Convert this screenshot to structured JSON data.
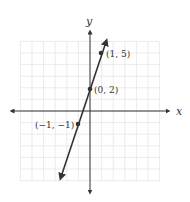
{
  "chart_data": {
    "type": "line",
    "title": "",
    "xlabel": "x",
    "ylabel": "y",
    "xlim": [
      -6,
      6
    ],
    "ylim": [
      -6,
      6
    ],
    "grid": true,
    "series": [
      {
        "name": "y = 3x + 2",
        "x": [
          -1,
          0,
          1
        ],
        "y": [
          -1,
          2,
          5
        ],
        "color": "#333333"
      }
    ],
    "points": [
      {
        "x": -1,
        "y": -1,
        "label": "(−1, −1)"
      },
      {
        "x": 0,
        "y": 2,
        "label": "(0, 2)"
      },
      {
        "x": 1,
        "y": 5,
        "label": "(1, 5)"
      }
    ]
  },
  "labels": {
    "x_axis": "x",
    "y_axis": "y",
    "p1": "(1, 5)",
    "p2": "(0, 2)",
    "p3": "(−1, −1)"
  },
  "colors": {
    "grid": "#e6e6e6",
    "axis": "#333333",
    "line": "#333333"
  }
}
